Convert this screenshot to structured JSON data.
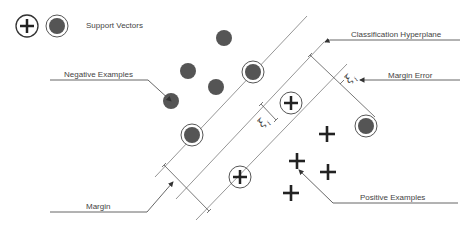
{
  "legend": {
    "label": "Support Vectors",
    "icons": [
      "plus-circle-icon",
      "filled-dot-circle-icon"
    ]
  },
  "labels": {
    "negative_examples": "Negative Examples",
    "classification_hyperplane": "Classification Hyperplane",
    "margin_error": "Margin Error",
    "margin": "Margin",
    "positive_examples": "Positive Examples"
  },
  "slack_symbol": {
    "main": "ξ",
    "sub": "i"
  },
  "colors": {
    "line": "#8a8a8a",
    "dot_fill": "#555555",
    "plus": "#222222",
    "text": "#444444"
  },
  "points": {
    "negative": [
      [
        224,
        38
      ],
      [
        188,
        71
      ],
      [
        216,
        87
      ],
      [
        171,
        101
      ]
    ],
    "negative_support": [
      [
        253,
        72
      ],
      [
        192,
        135
      ]
    ],
    "negative_error": [
      [
        366,
        126
      ]
    ],
    "positive": [
      [
        327,
        134
      ],
      [
        297,
        161
      ],
      [
        328,
        172
      ],
      [
        291,
        193
      ]
    ],
    "positive_support": [
      [
        291,
        103
      ],
      [
        240,
        177
      ]
    ]
  }
}
